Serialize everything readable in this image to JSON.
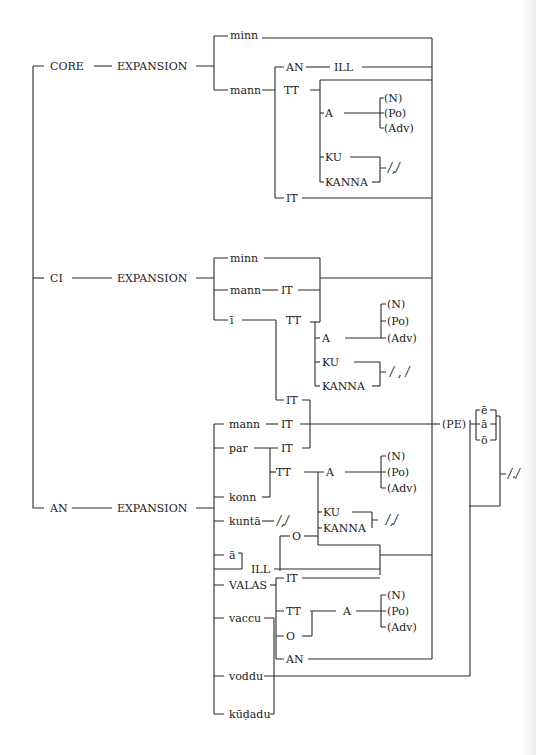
{
  "diagram": {
    "type": "tree-bracket-diagram",
    "roots": {
      "core": "CORE",
      "ci": "CI",
      "an": "AN"
    },
    "expansion": "EXPANSION",
    "core_branch": {
      "minn": "minn",
      "mann": "mann",
      "an": "AN",
      "ill": "ILL",
      "tt": "TT",
      "a": "A",
      "n": "(N)",
      "po": "(Po)",
      "adv": "(Adv)",
      "ku": "KU",
      "kanna": "KANNA",
      "comma": "/,/",
      "it": "IT"
    },
    "ci_branch": {
      "minn": "minn",
      "mann": "mann",
      "it1": "IT",
      "i": "ī",
      "tt": "TT",
      "a": "A",
      "n": "(N)",
      "po": "(Po)",
      "adv": "(Adv)",
      "ku": "KU",
      "kanna": "KANNA",
      "comma": "/ , /",
      "it2": "IT"
    },
    "an_branch": {
      "mann": "mann",
      "it1": "IT",
      "par": "par",
      "it2": "IT",
      "konn": "konn",
      "tt": "TT",
      "a": "A",
      "n": "(N)",
      "po": "(Po)",
      "adv": "(Adv)",
      "kunta": "kuntā",
      "comma1": "/,/",
      "ku": "KU",
      "kanna": "KANNA",
      "comma2": "/,/",
      "o1": "O",
      "a_long": "ā",
      "ill": "ILL",
      "valas": "VALAS",
      "it3": "IT",
      "tt2": "TT",
      "a2": "A",
      "n2": "(N)",
      "po2": "(Po)",
      "adv2": "(Adv)",
      "o2": "O",
      "an": "AN",
      "vaccu": "vaccu",
      "voddu": "voddu",
      "kudadu": "kūḍadu"
    },
    "final": {
      "pe": "(PE)",
      "e": "ē",
      "a": "ā",
      "o": "ō",
      "period": "/./"
    }
  }
}
